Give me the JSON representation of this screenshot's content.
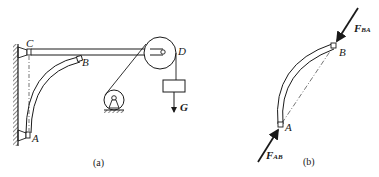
{
  "figure_a": {
    "caption": "(a)",
    "labels": {
      "C": "C",
      "B": "B",
      "A": "A",
      "D": "D",
      "G": "G"
    },
    "components": [
      "wall-support",
      "horizontal-beam-CD",
      "curved-bar-AB",
      "pulley-D",
      "winch",
      "weight-block",
      "cable"
    ]
  },
  "figure_b": {
    "caption": "(b)",
    "labels": {
      "A": "A",
      "B": "B",
      "F_BA_main": "F",
      "F_BA_sub": "BA",
      "F_AB_main": "F",
      "F_AB_sub": "AB"
    },
    "components": [
      "curved-bar-AB-free-body",
      "force-line",
      "chord-dash-dot"
    ]
  },
  "colors": {
    "ink": "#1a1a1a",
    "background": "#ffffff"
  }
}
